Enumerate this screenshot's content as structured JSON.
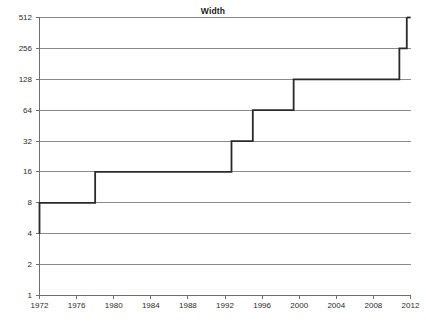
{
  "chart_data": {
    "type": "line",
    "title": "Width",
    "xlabel": "",
    "ylabel": "",
    "interpolation": "step-post",
    "grid": true,
    "legend": false,
    "legend_position": "none",
    "xlim": [
      1972,
      2012
    ],
    "ylim": [
      1,
      512
    ],
    "yscale": "log2",
    "xticks": [
      1972,
      1976,
      1980,
      1984,
      1988,
      1992,
      1996,
      2000,
      2004,
      2008,
      2012
    ],
    "xtick_labels": [
      "1972",
      "1976",
      "1980",
      "1984",
      "1988",
      "1992",
      "1996",
      "2000",
      "2004",
      "2008",
      "2012"
    ],
    "yticks": [
      1,
      2,
      4,
      8,
      16,
      32,
      64,
      128,
      256,
      512
    ],
    "ytick_labels": [
      "1",
      "2",
      "4",
      "8",
      "16",
      "32",
      "64",
      "128",
      "256",
      "512"
    ],
    "series": [
      {
        "name": "Width",
        "color": "#2a2a2a",
        "x": [
          1972.0,
          1972.0,
          1978.0,
          1978.0,
          1992.7,
          1992.7,
          1995.0,
          1995.0,
          1999.4,
          1999.4,
          2010.8,
          2010.8,
          2011.6,
          2011.6
        ],
        "y": [
          4,
          8,
          8,
          16,
          16,
          32,
          32,
          64,
          64,
          128,
          128,
          256,
          256,
          512
        ],
        "steps": [
          {
            "year": 1972.0,
            "value": 4
          },
          {
            "year": 1972.0,
            "value": 8
          },
          {
            "year": 1978.0,
            "value": 16
          },
          {
            "year": 1992.7,
            "value": 32
          },
          {
            "year": 1995.0,
            "value": 64
          },
          {
            "year": 1999.4,
            "value": 128
          },
          {
            "year": 2010.8,
            "value": 256
          },
          {
            "year": 2011.6,
            "value": 512
          }
        ]
      }
    ],
    "colors": {
      "line": "#2a2a2a",
      "grid": "#8a8a8a",
      "axis": "#6e6e6e",
      "text": "#2b2b2b",
      "background": "#ffffff"
    }
  }
}
